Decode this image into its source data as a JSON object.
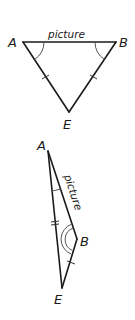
{
  "figure_top": {
    "vertices": {
      "A": "A",
      "B": "B",
      "E": "E"
    },
    "edge_label": "picture"
  },
  "figure_bottom": {
    "vertices": {
      "A": "A",
      "B": "B",
      "E": "E"
    },
    "edge_label": "picture"
  },
  "colors": {
    "line": "#1a1a1a",
    "arc": "#555555",
    "background": "#ffffff"
  }
}
